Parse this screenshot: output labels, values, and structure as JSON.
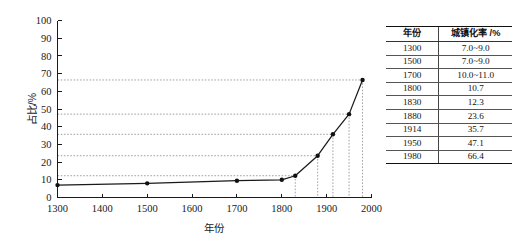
{
  "chart_data": {
    "type": "line",
    "title": "",
    "xlabel": "年份",
    "ylabel": "占比/%",
    "xlim": [
      1300,
      2000
    ],
    "ylim": [
      0,
      100
    ],
    "xticks": [
      1300,
      1400,
      1500,
      1600,
      1700,
      1800,
      1900,
      2000
    ],
    "yticks": [
      0,
      10,
      20,
      30,
      40,
      50,
      60,
      70,
      80,
      90,
      100
    ],
    "grid": false,
    "legend": null,
    "x": [
      1300,
      1500,
      1700,
      1800,
      1830,
      1880,
      1914,
      1950,
      1980
    ],
    "values": [
      7.0,
      8.0,
      9.5,
      10.0,
      12.3,
      23.6,
      35.7,
      47.1,
      66.4
    ],
    "leader_lines_at": [
      12.3,
      23.6,
      35.7,
      47.1,
      66.4
    ],
    "marker": "filled-circle",
    "line_color": "#1a1a1a",
    "leader_color": "#8a8a8a"
  },
  "chart": {
    "y_axis_title": "占比/%",
    "x_axis_title": "年份",
    "y_tick_labels": [
      "0",
      "10",
      "20",
      "30",
      "40",
      "50",
      "60",
      "70",
      "80",
      "90",
      "100"
    ],
    "x_tick_labels": [
      "1300",
      "1400",
      "1500",
      "1600",
      "1700",
      "1800",
      "1900",
      "2000"
    ]
  },
  "table": {
    "headers": [
      "年份",
      "城镇化率 /%"
    ],
    "rows": [
      {
        "year": "1300",
        "rate": "7.0~9.0"
      },
      {
        "year": "1500",
        "rate": "7.0~9.0"
      },
      {
        "year": "1700",
        "rate": "10.0~11.0"
      },
      {
        "year": "1800",
        "rate": "10.7"
      },
      {
        "year": "1830",
        "rate": "12.3"
      },
      {
        "year": "1880",
        "rate": "23.6"
      },
      {
        "year": "1914",
        "rate": "35.7"
      },
      {
        "year": "1950",
        "rate": "47.1"
      },
      {
        "year": "1980",
        "rate": "66.4"
      }
    ]
  }
}
